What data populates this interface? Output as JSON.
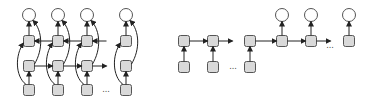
{
  "diagrams": [
    {
      "name": "bidirectional-rnn",
      "columns_x": [
        29,
        58,
        87,
        126
      ],
      "output_y": 15,
      "backward_y": 41,
      "forward_y": 66,
      "input_y": 90,
      "ellipsis": {
        "x": 106,
        "y": 92,
        "text": "..."
      }
    },
    {
      "name": "encoder-decoder-rnn",
      "encoder_x": [
        184,
        213,
        250
      ],
      "decoder_x": [
        282,
        311,
        349
      ],
      "hidden_y": 41,
      "input_y": 67,
      "output_y": 15,
      "encoder_ellipsis": {
        "x": 233,
        "y": 69,
        "text": "..."
      },
      "decoder_ellipsis": {
        "x": 330,
        "y": 48,
        "text": "..."
      }
    }
  ],
  "style": {
    "node_fill": "#d9d9d9",
    "node_stroke": "#555555",
    "circle_fill": "#ffffff",
    "edge_color": "#222222"
  }
}
